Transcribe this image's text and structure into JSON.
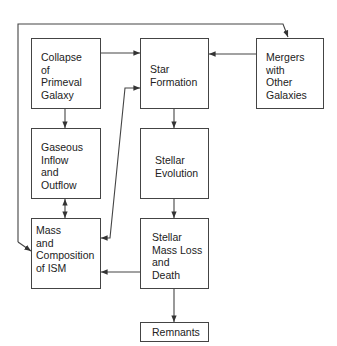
{
  "diagram": {
    "type": "flowchart",
    "nodes": [
      {
        "id": "collapse",
        "lines": [
          "Collapse",
          "of",
          "Primeval",
          "Galaxy"
        ]
      },
      {
        "id": "star_formation",
        "lines": [
          "Star",
          "Formation"
        ]
      },
      {
        "id": "mergers",
        "lines": [
          "Mergers",
          "with",
          "Other",
          "Galaxies"
        ]
      },
      {
        "id": "gaseous",
        "lines": [
          "Gaseous",
          "Inflow",
          "and",
          "Outflow"
        ]
      },
      {
        "id": "stellar_evolution",
        "lines": [
          "Stellar",
          "Evolution"
        ]
      },
      {
        "id": "mass_ism",
        "lines": [
          "Mass",
          "and",
          "Composition",
          "of ISM"
        ]
      },
      {
        "id": "mass_loss",
        "lines": [
          "Stellar",
          "Mass Loss",
          "and",
          "Death"
        ]
      },
      {
        "id": "remnants",
        "lines": [
          "Remnants"
        ]
      }
    ],
    "edges": [
      {
        "from": "collapse",
        "to": "star_formation"
      },
      {
        "from": "mergers",
        "to": "star_formation"
      },
      {
        "from": "collapse",
        "to": "gaseous"
      },
      {
        "from": "gaseous",
        "to": "mass_ism",
        "bidirectional": true
      },
      {
        "from": "mass_ism",
        "to": "star_formation",
        "bidirectional": true
      },
      {
        "from": "star_formation",
        "to": "stellar_evolution"
      },
      {
        "from": "stellar_evolution",
        "to": "mass_loss"
      },
      {
        "from": "mass_loss",
        "to": "mass_ism"
      },
      {
        "from": "mass_loss",
        "to": "remnants"
      },
      {
        "from": "outer_loop",
        "to": "mergers"
      },
      {
        "from": "outer_loop",
        "to": "mass_ism"
      }
    ],
    "stroke_color": "#444444"
  }
}
